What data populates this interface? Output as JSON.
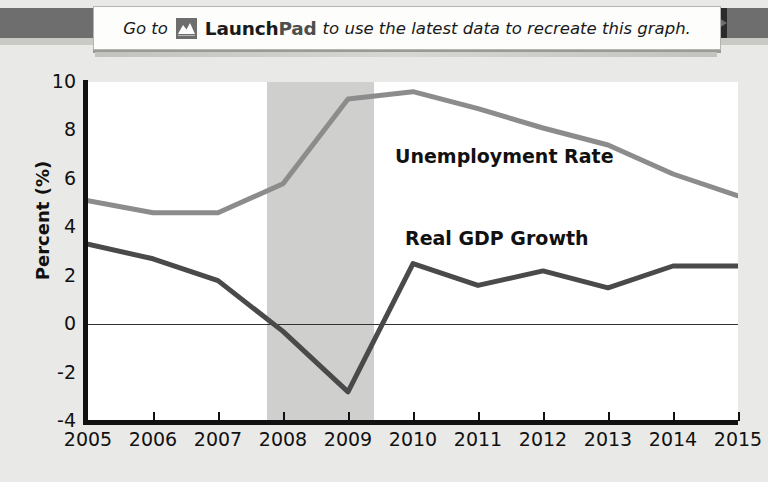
{
  "banner": {
    "text_before": "Go to",
    "logo_icon": "launchpad-mountain-icon",
    "brand_first": "Launch",
    "brand_second": "Pad",
    "text_after": "to use the latest data to recreate this graph."
  },
  "chart_data": {
    "type": "line",
    "title": "",
    "xlabel": "",
    "ylabel": "Percent (%)",
    "x": [
      2005,
      2006,
      2007,
      2008,
      2009,
      2010,
      2011,
      2012,
      2013,
      2014,
      2015
    ],
    "xtick_labels": [
      "2005",
      "2006",
      "2007",
      "2008",
      "2009",
      "2010",
      "2011",
      "2012",
      "2013",
      "2014",
      "2015"
    ],
    "ytick_labels": [
      "10",
      "8",
      "6",
      "4",
      "2",
      "0",
      "-2",
      "-4"
    ],
    "yticks": [
      10,
      8,
      6,
      4,
      2,
      0,
      -2,
      -4
    ],
    "ylim": [
      -4,
      10
    ],
    "xlim": [
      2005,
      2015
    ],
    "grid": false,
    "legend_position": "inline-annotation",
    "zero_line": 0,
    "shaded_region": {
      "label": "recession",
      "x_start": 2007.75,
      "x_end": 2009.4,
      "color": "#cfcfcd"
    },
    "series": [
      {
        "name": "Unemployment Rate",
        "color": "#8c8c8c",
        "values": [
          5.1,
          4.6,
          4.6,
          5.8,
          9.3,
          9.6,
          8.9,
          8.1,
          7.4,
          6.2,
          5.3
        ]
      },
      {
        "name": "Real GDP Growth",
        "color": "#4a4a4a",
        "values": [
          3.3,
          2.7,
          1.8,
          -0.3,
          -2.8,
          2.5,
          1.6,
          2.2,
          1.5,
          2.4,
          2.4
        ]
      }
    ]
  }
}
